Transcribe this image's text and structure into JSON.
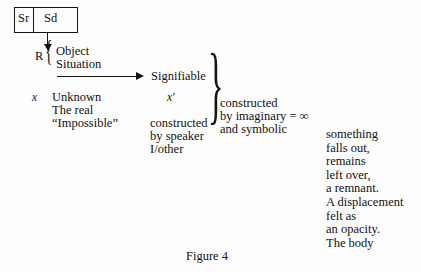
{
  "figure": {
    "caption": "Figure 4",
    "sign_box": {
      "left_cell": "Sr",
      "right_cell": "Sd"
    },
    "referent_label": "R",
    "referent_brace": "{",
    "referent_items": [
      "Object",
      "Situation"
    ],
    "arrow_target": "Signifiable",
    "left_column": {
      "variable": "x",
      "lines": [
        "Unknown",
        "The real",
        "“Impossible”"
      ]
    },
    "middle_column": {
      "variable": "x′",
      "lines": [
        "constructed",
        "by speaker",
        "I/other"
      ]
    },
    "large_brace": "}",
    "right_column": {
      "lines": [
        "constructed",
        "by imaginary = ∞",
        "and symbolic"
      ]
    },
    "remnant_text": {
      "lines": [
        "something",
        "falls out,",
        "remains",
        "left over,",
        "a remnant.",
        "A displacement",
        "felt as",
        "an opacity.",
        "The body"
      ]
    }
  },
  "colors": {
    "ink": "#111111",
    "rule": "#151515",
    "background": "#fdfdfd"
  }
}
